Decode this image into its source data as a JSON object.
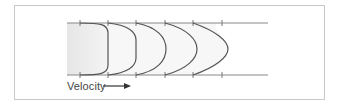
{
  "diagram": {
    "label": "Velocity",
    "arrow_direction": "right",
    "colors": {
      "frame": "#c8c8c8",
      "wall": "#888888",
      "profile": "#555555",
      "fill": "#ececec",
      "text": "#444444"
    },
    "pipe": {
      "x_start": 67,
      "x_end": 268,
      "y_top": 23,
      "y_bottom": 75
    },
    "ticks_x": [
      80,
      108,
      136,
      165,
      193,
      222
    ],
    "profiles": [
      {
        "start_x": 80,
        "tip_x": 108,
        "shape": "blunt"
      },
      {
        "start_x": 108,
        "tip_x": 136,
        "shape": "rounded"
      },
      {
        "start_x": 136,
        "tip_x": 166,
        "shape": "rounded"
      },
      {
        "start_x": 165,
        "tip_x": 197,
        "shape": "curved"
      },
      {
        "start_x": 193,
        "tip_x": 228,
        "shape": "parabolic"
      }
    ]
  }
}
